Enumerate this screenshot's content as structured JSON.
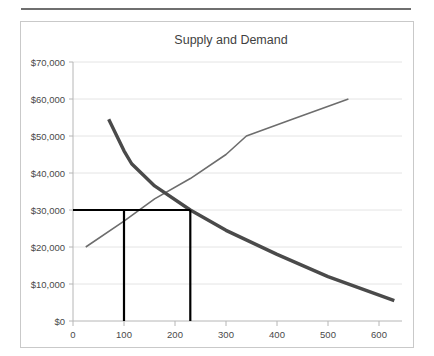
{
  "chart_data": {
    "type": "line",
    "title": "Supply and Demand",
    "xlabel": "",
    "ylabel": "",
    "xlim": [
      0,
      650
    ],
    "ylim": [
      0,
      70000
    ],
    "grid": true,
    "legend": "none",
    "x_ticks": [
      0,
      100,
      200,
      300,
      400,
      500,
      600
    ],
    "x_tick_labels": [
      "0",
      "100",
      "200",
      "300",
      "400",
      "500",
      "600"
    ],
    "y_ticks": [
      0,
      10000,
      20000,
      30000,
      40000,
      50000,
      60000,
      70000
    ],
    "y_tick_labels": [
      "$0",
      "$10,000",
      "$20,000",
      "$30,000",
      "$40,000",
      "$50,000",
      "$60,000",
      "$70,000"
    ],
    "series": [
      {
        "name": "Demand",
        "color": "#4a4a4a",
        "points": [
          [
            70,
            54500
          ],
          [
            100,
            46000
          ],
          [
            115,
            42500
          ],
          [
            160,
            36500
          ],
          [
            230,
            30000
          ],
          [
            300,
            24500
          ],
          [
            400,
            18000
          ],
          [
            500,
            12000
          ],
          [
            630,
            5500
          ]
        ]
      },
      {
        "name": "Supply",
        "color": "#6d6d6d",
        "points": [
          [
            25,
            20000
          ],
          [
            100,
            27000
          ],
          [
            160,
            33000
          ],
          [
            230,
            38500
          ],
          [
            300,
            45000
          ],
          [
            340,
            50000
          ],
          [
            430,
            54500
          ],
          [
            540,
            60000
          ]
        ]
      }
    ],
    "annotations": [
      {
        "name": "equilibrium-price-line",
        "type": "horizontal-reference-line",
        "y": 30000,
        "x_start": 0,
        "x_end": 230,
        "color": "#000000"
      },
      {
        "name": "quantity-demanded-line",
        "type": "vertical-reference-line",
        "x": 100,
        "y_start": 0,
        "y_end": 30000,
        "color": "#000000"
      },
      {
        "name": "quantity-supplied-line",
        "type": "vertical-reference-line",
        "x": 230,
        "y_start": 0,
        "y_end": 30000,
        "color": "#000000"
      }
    ]
  },
  "chart": {
    "title": "Supply and Demand",
    "y_labels": {
      "t0": "$0",
      "t1": "$10,000",
      "t2": "$20,000",
      "t3": "$30,000",
      "t4": "$40,000",
      "t5": "$50,000",
      "t6": "$60,000",
      "t7": "$70,000"
    },
    "x_labels": {
      "t0": "0",
      "t1": "100",
      "t2": "200",
      "t3": "300",
      "t4": "400",
      "t5": "500",
      "t6": "600"
    }
  }
}
